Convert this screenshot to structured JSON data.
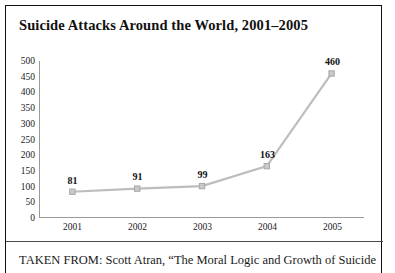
{
  "figure": {
    "title": "Suicide Attacks Around the World, 2001–2005",
    "caption": "TAKEN FROM: Scott Atran, “The Moral Logic and Growth of Suicide"
  },
  "colors": {
    "line": "#bdbdbd",
    "marker": "#c9c9c9",
    "marker_edge": "#a8a8a8",
    "axis": "#9a9a9a",
    "border": "#111111",
    "text": "#111111"
  },
  "chart_data": {
    "type": "line",
    "title": "Suicide Attacks Around the World, 2001–2005",
    "xlabel": "",
    "ylabel": "",
    "categories": [
      "2001",
      "2002",
      "2003",
      "2004",
      "2005"
    ],
    "values": [
      81,
      91,
      99,
      163,
      460
    ],
    "point_labels": [
      "81",
      "91",
      "99",
      "163",
      "460"
    ],
    "ylim": [
      0,
      500
    ],
    "ytick_step": 50,
    "yticks": [
      500,
      450,
      400,
      350,
      300,
      250,
      200,
      150,
      100,
      50,
      0
    ],
    "ytick_labels": [
      "500",
      "450",
      "400",
      "350",
      "300",
      "250",
      "200",
      "150",
      "100",
      "50",
      "0"
    ],
    "grid": false,
    "legend": null,
    "marker": "square"
  }
}
